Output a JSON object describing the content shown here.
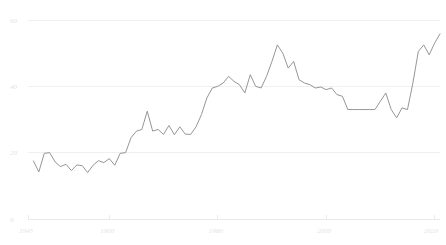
{
  "chart_data": {
    "type": "line",
    "title": "",
    "subtitle": "",
    "xlabel": "",
    "ylabel": "",
    "xlim": [
      1945,
      2021
    ],
    "ylim": [
      0,
      60
    ],
    "grid": true,
    "legend": false,
    "legend_position": "none",
    "line_color": "#8a8a8a",
    "grid_color": "#f0f0f0",
    "label_color": "#e4e4e4",
    "y_ticks": [
      0,
      20,
      40,
      60
    ],
    "y_tick_labels": [
      "0",
      "20",
      "40",
      "60"
    ],
    "x_ticks": [
      1945,
      1960,
      1980,
      2000,
      2020
    ],
    "x_tick_labels": [
      "1945",
      "1960",
      "1980",
      "2000",
      "2020"
    ],
    "series": [
      {
        "name": "series-1",
        "x": [
          1946,
          1947,
          1948,
          1949,
          1950,
          1951,
          1952,
          1953,
          1954,
          1955,
          1956,
          1957,
          1958,
          1959,
          1960,
          1961,
          1962,
          1963,
          1964,
          1965,
          1966,
          1967,
          1968,
          1969,
          1970,
          1971,
          1972,
          1973,
          1974,
          1975,
          1976,
          1977,
          1978,
          1979,
          1980,
          1981,
          1982,
          1983,
          1984,
          1985,
          1986,
          1987,
          1988,
          1989,
          1990,
          1991,
          1992,
          1993,
          1994,
          1995,
          1996,
          1997,
          1998,
          1999,
          2000,
          2001,
          2002,
          2003,
          2004,
          2005,
          2006,
          2007,
          2008,
          2009,
          2010,
          2011,
          2012,
          2013,
          2014,
          2015,
          2016,
          2017,
          2018,
          2019,
          2020,
          2021
        ],
        "values": [
          17.5,
          14.2,
          19.8,
          20.0,
          17.2,
          15.8,
          16.5,
          14.6,
          16.3,
          16.1,
          14.0,
          16.2,
          17.6,
          17.0,
          18.2,
          16.2,
          19.8,
          20.0,
          24.5,
          26.5,
          27.0,
          32.5,
          26.5,
          27.0,
          25.5,
          28.2,
          25.4,
          27.8,
          25.6,
          25.5,
          27.8,
          31.5,
          36.5,
          39.5,
          40.0,
          41.0,
          43.0,
          41.5,
          40.5,
          38.0,
          43.5,
          40.0,
          39.5,
          43.0,
          47.5,
          52.5,
          50.0,
          45.5,
          47.5,
          42.0,
          41.0,
          40.5,
          39.5,
          39.8,
          39.0,
          39.5,
          37.5,
          37.0,
          33.0,
          33.0,
          33.0,
          33.0,
          33.0,
          33.0,
          35.5,
          38.0,
          33.0,
          30.5,
          33.5,
          33.0,
          41.0,
          50.5,
          52.5,
          49.5,
          53.0,
          55.8
        ]
      }
    ]
  },
  "axes": {
    "y_axis_name": "y-axis",
    "x_axis_name": "x-axis"
  }
}
